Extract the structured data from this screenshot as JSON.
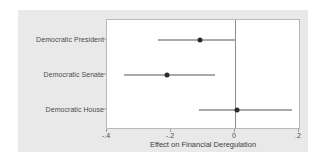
{
  "chart_data": {
    "type": "scatter",
    "title": "",
    "xlabel": "Effect on Financial Deregulation",
    "ylabel": "",
    "xlim": [
      -0.4,
      0.2
    ],
    "xticks": [
      -0.4,
      -0.2,
      0.0,
      0.2
    ],
    "xticklabels": [
      "-.4",
      "-.2",
      "0",
      ".2"
    ],
    "grid": false,
    "legend": null,
    "reference_line_x": 0,
    "categories": [
      "Democratic President",
      "Democratic Senate",
      "Democratic House"
    ],
    "values": [
      -0.11,
      -0.213,
      0.005
    ],
    "ci_low": [
      -0.24,
      -0.347,
      -0.113
    ],
    "ci_high": [
      0.0,
      -0.063,
      0.177
    ],
    "series": [
      {
        "name": "Coefficient estimate with 95% confidence interval",
        "points": [
          {
            "category": "Democratic President",
            "estimate": -0.11,
            "ci_low": -0.24,
            "ci_high": 0.0
          },
          {
            "category": "Democratic Senate",
            "estimate": -0.213,
            "ci_low": -0.347,
            "ci_high": -0.063
          },
          {
            "category": "Democratic House",
            "estimate": 0.005,
            "ci_low": -0.113,
            "ci_high": 0.177
          }
        ]
      }
    ],
    "colors": {
      "panel_background": "#e9e9e9",
      "plot_background": "#ffffff",
      "marker": "#2b2b2b",
      "interval": "#555555",
      "reference_line": "#8c8c8c",
      "axis": "#b9b9b9",
      "text": "#4c4c4c"
    }
  }
}
